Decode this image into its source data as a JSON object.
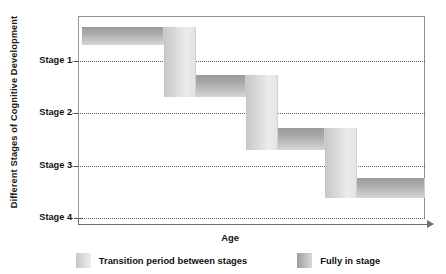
{
  "chart_data": {
    "type": "bar",
    "title": "",
    "xlabel": "Age",
    "ylabel": "Different Stages of Cognitive Development",
    "grid": true,
    "legend_position": "bottom",
    "categories": [
      "Stage 1",
      "Stage 2",
      "Stage 3",
      "Stage 4"
    ],
    "ytick_labels": [
      "Stage 1",
      "Stage 2",
      "Stage 3",
      "Stage 4"
    ],
    "ylim": [
      4,
      1
    ],
    "series": [
      {
        "name": "Fully in stage",
        "kind": "plateau",
        "color": "#a9a9a9",
        "segments": [
          {
            "stage": "Stage 1",
            "x_start": 4,
            "x_end": 27,
            "level": 1
          },
          {
            "stage": "Stage 2",
            "x_start": 36,
            "x_end": 50,
            "level": 2
          },
          {
            "stage": "Stage 3",
            "x_start": 59,
            "x_end": 72,
            "level": 3
          },
          {
            "stage": "Stage 4",
            "x_start": 81,
            "x_end": 100,
            "level": 4
          }
        ]
      },
      {
        "name": "Transition period between stages",
        "kind": "riser",
        "color": "#dedede",
        "segments": [
          {
            "from": "Stage 1",
            "to": "Stage 2",
            "x_start": 27,
            "x_end": 36
          },
          {
            "from": "Stage 2",
            "to": "Stage 3",
            "x_start": 50,
            "x_end": 59
          },
          {
            "from": "Stage 3",
            "to": "Stage 4",
            "x_start": 72,
            "x_end": 81
          }
        ]
      }
    ],
    "legend": [
      {
        "label": "Transition period between stages",
        "swatch": "transition"
      },
      {
        "label": "Fully in stage",
        "swatch": "fully"
      }
    ]
  },
  "axes": {
    "y_title": "Different Stages of Cognitive Development",
    "x_title": "Age",
    "ticks": [
      {
        "label": "Stage 1",
        "top": 45
      },
      {
        "label": "Stage 2",
        "top": 97
      },
      {
        "label": "Stage 3",
        "top": 150
      },
      {
        "label": "Stage 4",
        "top": 202
      }
    ]
  },
  "geometry": {
    "gridlines": [
      45,
      97,
      150,
      202
    ],
    "bars": [
      {
        "name": "stage-1-plateau-bar",
        "kind": "stage",
        "left": 4,
        "top": 11,
        "width": 82,
        "height": 18
      },
      {
        "name": "transition-1-riser-bar",
        "kind": "transition",
        "left": 86,
        "top": 11,
        "width": 32,
        "height": 70
      },
      {
        "name": "stage-2-plateau-bar",
        "kind": "stage",
        "left": 118,
        "top": 59,
        "width": 50,
        "height": 22
      },
      {
        "name": "transition-2-riser-bar",
        "kind": "transition",
        "left": 168,
        "top": 59,
        "width": 32,
        "height": 75
      },
      {
        "name": "stage-3-plateau-bar",
        "kind": "stage",
        "left": 200,
        "top": 112,
        "width": 47,
        "height": 22
      },
      {
        "name": "transition-3-riser-bar",
        "kind": "transition",
        "left": 247,
        "top": 112,
        "width": 32,
        "height": 70
      },
      {
        "name": "stage-4-plateau-bar",
        "kind": "stage",
        "left": 279,
        "top": 162,
        "width": 68,
        "height": 20
      }
    ]
  }
}
